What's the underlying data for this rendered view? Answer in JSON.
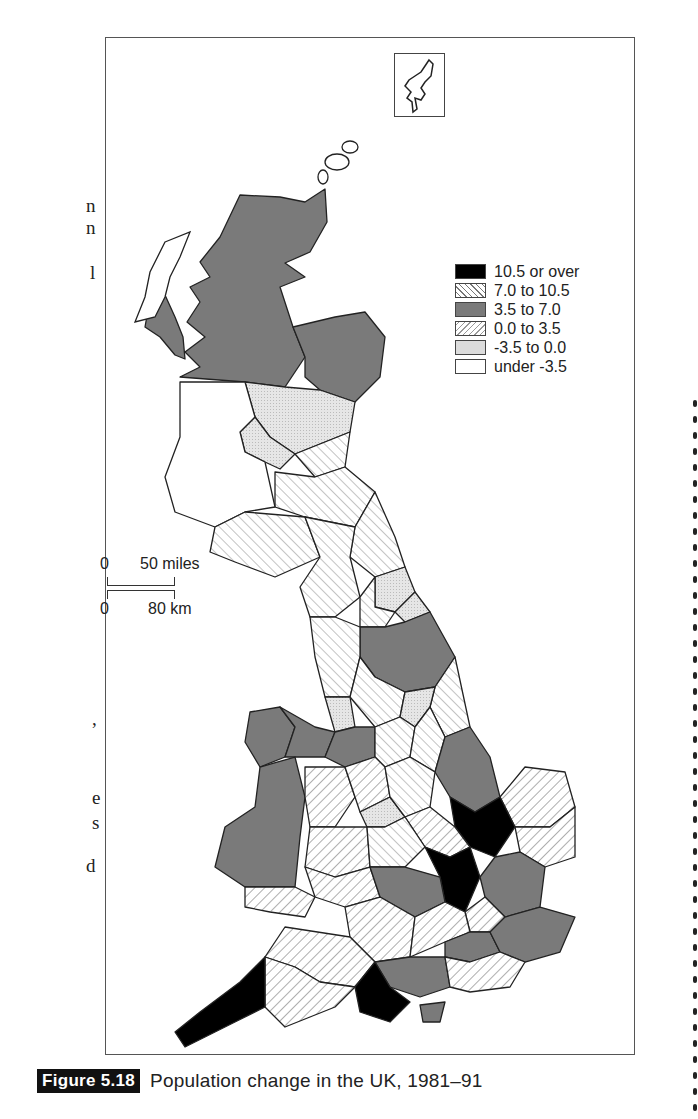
{
  "figure": {
    "label": "Figure 5.18",
    "title": "Population change in the UK, 1981–91"
  },
  "legend": {
    "items": [
      {
        "label": "10.5 or over",
        "pattern": "solid-black",
        "color": "#000000"
      },
      {
        "label": "7.0 to 10.5",
        "pattern": "backslash-hatch",
        "color": "#ffffff"
      },
      {
        "label": "3.5 to 7.0",
        "pattern": "solid-grey",
        "color": "#7a7a7a"
      },
      {
        "label": "0.0 to 3.5",
        "pattern": "slash-hatch",
        "color": "#ffffff"
      },
      {
        "label": "-3.5 to 0.0",
        "pattern": "dotted-light-grey",
        "color": "#dcdcdc"
      },
      {
        "label": "under -3.5",
        "pattern": "blank",
        "color": "#ffffff"
      }
    ]
  },
  "scale_bar": {
    "miles_zero": "0",
    "miles_label": "50 miles",
    "km_zero": "0",
    "km_label": "80 km"
  },
  "inset": {
    "name": "Shetland"
  },
  "left_margin_fragments": [
    "n",
    "l",
    ",",
    "e",
    "s",
    "d"
  ]
}
